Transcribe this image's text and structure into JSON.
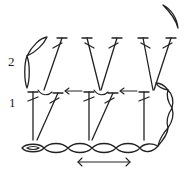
{
  "diagram": {
    "type": "crochet-stitch-chart",
    "row_labels": [
      {
        "label": "2",
        "x": 8,
        "y": 66
      },
      {
        "label": "1",
        "x": 9,
        "y": 107
      }
    ],
    "foundation_chain": {
      "y": 148,
      "start_x": 22,
      "chain_count": 6,
      "chain_width": 22
    },
    "turning_chains": [
      {
        "side": "left",
        "row": 2
      },
      {
        "side": "right",
        "row": 1
      },
      {
        "side": "top-right",
        "row": 2
      }
    ],
    "row1_stitches": [
      {
        "symbol": "double-crochet",
        "x1": 33,
        "y1": 140,
        "x2": 33,
        "y2": 92
      },
      {
        "symbol": "double-crochet",
        "x1": 37,
        "y1": 140,
        "x2": 58,
        "y2": 93
      },
      {
        "symbol": "double-crochet",
        "x1": 89,
        "y1": 140,
        "x2": 89,
        "y2": 92
      },
      {
        "symbol": "double-crochet",
        "x1": 92,
        "y1": 140,
        "x2": 113,
        "y2": 93
      },
      {
        "symbol": "double-crochet",
        "x1": 144,
        "y1": 140,
        "x2": 144,
        "y2": 92
      }
    ],
    "row2_stitches": [
      {
        "symbol": "double-crochet",
        "x1": 44,
        "y1": 90,
        "x2": 62,
        "y2": 38
      },
      {
        "symbol": "double-crochet",
        "x1": 100,
        "y1": 90,
        "x2": 87,
        "y2": 38
      },
      {
        "symbol": "double-crochet",
        "x1": 101,
        "y1": 90,
        "x2": 117,
        "y2": 38
      },
      {
        "symbol": "double-crochet",
        "x1": 153,
        "y1": 90,
        "x2": 143,
        "y2": 38
      },
      {
        "symbol": "double-crochet",
        "x1": 154,
        "y1": 90,
        "x2": 171,
        "y2": 38
      }
    ],
    "direction_arrows": [
      {
        "from_x": 85,
        "to_x": 66,
        "y": 91
      },
      {
        "from_x": 139,
        "to_x": 120,
        "y": 91
      }
    ],
    "repeat_arrow": {
      "x1": 78,
      "x2": 130,
      "y": 162,
      "double_headed": true
    }
  }
}
